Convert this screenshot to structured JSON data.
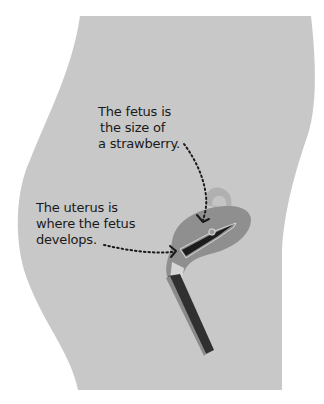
{
  "diagram": {
    "colors": {
      "body": "#c8c8c8",
      "uterus": "#8f8f8f",
      "uterus_light": "#a8a8a8",
      "bladder": "#b2b2b2",
      "vagina_canal": "#303030",
      "fetus": "#8a8a8a",
      "arrow": "#1a1a1a",
      "background": "#ffffff"
    },
    "annotations": [
      {
        "id": "fetus",
        "lines": [
          "The fetus is",
          "the size of",
          "a strawberry."
        ],
        "target": "fetus"
      },
      {
        "id": "uterus",
        "lines": [
          "The uterus is",
          "where the fetus",
          "develops."
        ],
        "target": "uterus"
      }
    ]
  }
}
